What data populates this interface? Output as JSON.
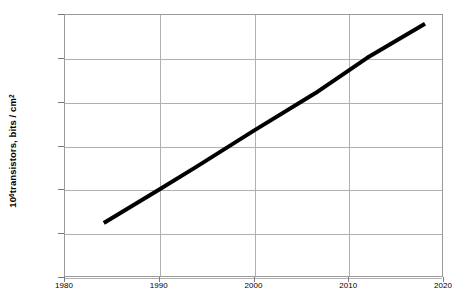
{
  "chart_data": {
    "type": "line",
    "title": "",
    "subtitle": "",
    "xlabel": "",
    "ylabel": "10^6 transistors, bits / cm^2",
    "ylabel_base": "10",
    "ylabel_exponent": "6",
    "ylabel_rest": "transistors, bits / cm",
    "ylabel_rest_exponent": "2",
    "scale": {
      "x": "linear",
      "y": "log"
    },
    "xlim": [
      1980,
      2020
    ],
    "ylim": [
      0.01,
      10000
    ],
    "grid": true,
    "legend": false,
    "legend_position": "none",
    "x_tick_labels": [
      "1980",
      "1990",
      "2000",
      "2010",
      "2020"
    ],
    "x_ticks": [
      1980,
      1990,
      2000,
      2010,
      2020
    ],
    "y_tick_labels": [
      "10000.00",
      "1000.00",
      "100.00",
      "10.00",
      "1.00",
      "0.10",
      "0.01"
    ],
    "y_ticks": [
      10000,
      1000,
      100,
      10,
      1,
      0.1,
      0.01
    ],
    "series": [
      {
        "name": "transistor density",
        "color": "#000000",
        "line_width": 4,
        "x": [
          1984.2,
          1990.1,
          1994.0,
          2000.0,
          2006.5,
          2012.0,
          2018.1
        ],
        "y": [
          0.17,
          1.0,
          3.3,
          21.5,
          155.0,
          1000.0,
          6000.0
        ]
      }
    ],
    "annotations": []
  }
}
